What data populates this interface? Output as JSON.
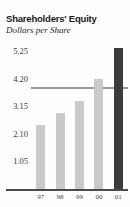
{
  "chart_data": {
    "type": "bar",
    "title": "Shareholders' Equity",
    "subtitle": "Dollars per Share",
    "xlabel": "",
    "ylabel": "Dollars per Share",
    "categories": [
      "97",
      "98",
      "99",
      "00",
      "01"
    ],
    "values": [
      2.45,
      2.89,
      3.37,
      4.21,
      5.37
    ],
    "ytick_labels": [
      "5.25",
      "4.20",
      "3.15",
      "2.10",
      "1.05"
    ],
    "ytick_values": [
      5.25,
      4.2,
      3.15,
      2.1,
      1.05
    ],
    "ylim": [
      0,
      5.25
    ],
    "grid": true,
    "gridline_at": 5.25,
    "legend": "none",
    "bar_color": "#c9c9c9",
    "highlight_color": "#3b3b3b",
    "highlighted_index": 4,
    "axis_color": "#4a4a4a"
  }
}
